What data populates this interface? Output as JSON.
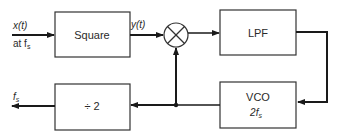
{
  "diagram": {
    "type": "block-diagram",
    "input": {
      "signal": "x(t)",
      "rate_label": "at f",
      "rate_sub": "s"
    },
    "blocks": [
      {
        "id": "square",
        "label": "Square"
      },
      {
        "id": "mixer",
        "label": "multiplier"
      },
      {
        "id": "lpf",
        "label": "LPF"
      },
      {
        "id": "vco",
        "label": "VCO",
        "sublabel_prefix": "2f",
        "sublabel_sub": "s"
      },
      {
        "id": "divider",
        "label": "÷ 2"
      }
    ],
    "signals": {
      "square_out": "y(t)",
      "output_main": "f",
      "output_sub": "s"
    },
    "colors": {
      "line": "#1a1a1a",
      "box": "#333333",
      "background": "#ffffff"
    }
  }
}
